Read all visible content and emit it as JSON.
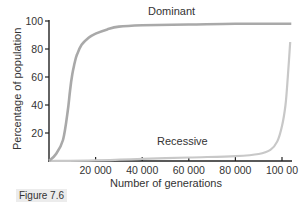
{
  "chart_data": {
    "type": "line",
    "title": "",
    "xlabel": "Number of generations",
    "ylabel": "Percentage of population",
    "xlim": [
      0,
      105000
    ],
    "ylim": [
      0,
      100
    ],
    "x_ticks": [
      20000,
      40000,
      60000,
      80000,
      100000
    ],
    "x_tick_labels": [
      "20 000",
      "40 000",
      "60 000",
      "80 000",
      "100 00"
    ],
    "y_ticks": [
      20,
      40,
      60,
      80,
      100
    ],
    "y_tick_labels": [
      "20",
      "40",
      "60",
      "80",
      "100"
    ],
    "grid": false,
    "legend": "inline labels",
    "series": [
      {
        "name": "Dominant",
        "color": "#a9a9a9",
        "x": [
          0,
          3000,
          6000,
          8000,
          9000,
          10000,
          11000,
          12000,
          14000,
          17000,
          20000,
          25000,
          30000,
          40000,
          60000,
          80000,
          104000
        ],
        "values": [
          0,
          5,
          15,
          35,
          50,
          62,
          70,
          76,
          83,
          88,
          91,
          94,
          96,
          97,
          97.5,
          98,
          98
        ]
      },
      {
        "name": "Recessive",
        "color": "#c8c8c8",
        "x": [
          0,
          20000,
          40000,
          60000,
          80000,
          90000,
          95000,
          98000,
          100000,
          101500,
          102500,
          103500
        ],
        "values": [
          0,
          0.5,
          1.5,
          2.5,
          3.5,
          5,
          8,
          14,
          25,
          40,
          60,
          85
        ]
      }
    ]
  },
  "labels": {
    "dominant": "Dominant",
    "recessive": "Recessive",
    "xlabel": "Number of generations",
    "ylabel": "Percentage of population",
    "caption": "Figure 7.6"
  }
}
